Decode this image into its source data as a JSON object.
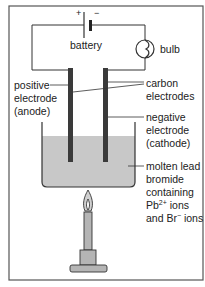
{
  "diagram": {
    "battery": {
      "label": "battery",
      "plus": "+",
      "minus": "−"
    },
    "bulb": {
      "label": "bulb"
    },
    "labels": {
      "positive_electrode": [
        "positive",
        "electrode",
        "(anode)"
      ],
      "carbon_electrodes": [
        "carbon",
        "electrodes"
      ],
      "negative_electrode": [
        "negative",
        "electrode",
        "(cathode)"
      ],
      "electrolyte": {
        "line1": "molten lead",
        "line2": "bromide",
        "line3": "containing",
        "line4_prefix": "Pb",
        "line4_sup": "2+",
        "line4_suffix": " ions",
        "line5_prefix": "and Br",
        "line5_sup": "−",
        "line5_suffix": " ions"
      }
    },
    "colors": {
      "border": "#555555",
      "wire": "#333333",
      "electrode": "#3a3a3a",
      "liquid": "#c8c8c8",
      "burner": "#b5b5b5"
    }
  }
}
